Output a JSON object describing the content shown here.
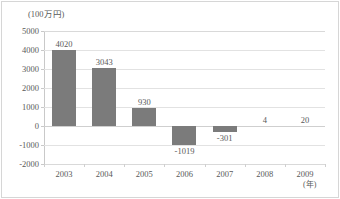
{
  "chart_data": {
    "type": "bar",
    "title": "",
    "subtitle": "",
    "xlabel": "(年)",
    "ylabel": "(100万円)",
    "categories": [
      "2003",
      "2004",
      "2005",
      "2006",
      "2007",
      "2008",
      "2009"
    ],
    "values": [
      4020,
      3043,
      930,
      -1019,
      -301,
      4,
      20
    ],
    "value_labels": [
      "4020",
      "3043",
      "930",
      "-1019",
      "-301",
      "4",
      "20"
    ],
    "series": [
      {
        "name": "",
        "values": [
          4020,
          3043,
          930,
          -1019,
          -301,
          4,
          20
        ],
        "color": "#7b7b7b"
      }
    ],
    "ylim": [
      -2000,
      5000
    ],
    "ytick_values": [
      5000,
      4000,
      3000,
      2000,
      1000,
      0,
      -1000,
      -2000
    ],
    "ytick_labels": [
      "5000",
      "4000",
      "3000",
      "2000",
      "1000",
      "0",
      "-1000",
      "-2000"
    ],
    "grid": true,
    "grid_axis": "y",
    "legend": false,
    "legend_position": "none",
    "bar_color": "#7b7b7b",
    "grid_color": "#e2e2e2",
    "axis_color": "#c9c9c9",
    "text_color": "#595959",
    "background": "#ffffff"
  }
}
